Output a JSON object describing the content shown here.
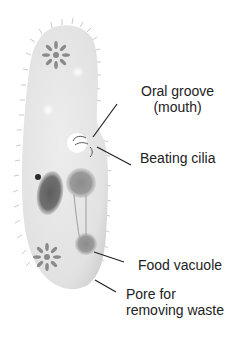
{
  "diagram": {
    "labels": {
      "oral_groove_line1": "Oral groove",
      "oral_groove_line2": "(mouth)",
      "beating_cilia": "Beating cilia",
      "food_vacuole": "Food vacuole",
      "pore_line1": "Pore for",
      "pore_line2": "removing waste"
    },
    "colors": {
      "body": "#e6e6e6",
      "organelle": "#8a8a8a",
      "nucleus": "#6a6a6a",
      "text": "#222222",
      "leader_line": "#222222"
    }
  }
}
